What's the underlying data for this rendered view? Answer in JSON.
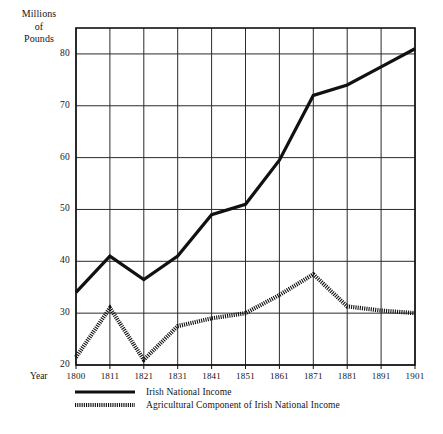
{
  "chart_data": {
    "type": "line",
    "title": "",
    "xlabel": "Year",
    "ylabel": "Millions of Pounds",
    "ylabel_lines": [
      "Millions",
      "of",
      "Pounds"
    ],
    "xlim": [
      1800,
      1901
    ],
    "ylim": [
      20,
      85
    ],
    "grid": true,
    "legend_position": "below-plot",
    "x": [
      1800,
      1811,
      1821,
      1831,
      1841,
      1851,
      1861,
      1871,
      1881,
      1891,
      1901
    ],
    "categories": [
      "1800",
      "1811",
      "1821",
      "1831",
      "1841",
      "1851",
      "1861",
      "1871",
      "1881",
      "1891",
      "1901"
    ],
    "yticks": [
      20,
      30,
      40,
      50,
      60,
      70,
      80
    ],
    "ytick_labels": [
      "20",
      "30",
      "40",
      "50",
      "60",
      "70",
      "80"
    ],
    "xtick_labels": [
      "1800",
      "1811",
      "1821",
      "1831",
      "1841",
      "1851",
      "1861",
      "1871",
      "1881",
      "1891",
      "1901"
    ],
    "series": [
      {
        "name": "Irish National Income",
        "style": "solid",
        "color": "#111111",
        "values": [
          34.0,
          41.0,
          36.5,
          41.0,
          49.0,
          51.0,
          59.5,
          72.0,
          74.0,
          77.5,
          81.0
        ]
      },
      {
        "name": "Agricultural Component of Irish National Income",
        "style": "hatched",
        "color": "#111111",
        "values": [
          21.5,
          31.0,
          21.0,
          27.5,
          29.0,
          30.0,
          33.5,
          37.5,
          31.3,
          30.5,
          30.0
        ]
      }
    ]
  },
  "legend": {
    "items": [
      {
        "label": "Irish National Income",
        "swatch": "solid-line-swatch"
      },
      {
        "label": "Agricultural Component of Irish National Income",
        "swatch": "hatched-line-swatch"
      }
    ]
  },
  "colors": {
    "ink": "#111111",
    "grid": "#2a2a2a",
    "background": "#ffffff"
  }
}
